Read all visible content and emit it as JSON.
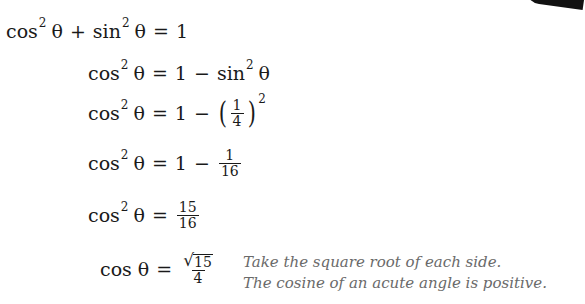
{
  "document": {
    "lines": [
      {
        "lhs_fn": "cos",
        "lhs_exp": "2",
        "lhs_var": "θ",
        "op1": "+",
        "term_fn": "sin",
        "term_exp": "2",
        "term_var": "θ",
        "eq": "=",
        "rhs": "1"
      },
      {
        "lhs_fn": "cos",
        "lhs_exp": "2",
        "lhs_var": "θ",
        "eq": "=",
        "rhs_a": "1",
        "minus": "−",
        "rhs_fn": "sin",
        "rhs_exp": "2",
        "rhs_var": "θ"
      },
      {
        "lhs_fn": "cos",
        "lhs_exp": "2",
        "lhs_var": "θ",
        "eq": "=",
        "rhs_a": "1",
        "minus": "−",
        "lparen": "(",
        "num": "1",
        "den": "4",
        "rparen": ")",
        "exp": "2"
      },
      {
        "lhs_fn": "cos",
        "lhs_exp": "2",
        "lhs_var": "θ",
        "eq": "=",
        "rhs_a": "1",
        "minus": "−",
        "num": "1",
        "den": "16"
      },
      {
        "lhs_fn": "cos",
        "lhs_exp": "2",
        "lhs_var": "θ",
        "eq": "=",
        "num": "15",
        "den": "16"
      },
      {
        "lhs_fn": "cos",
        "lhs_var": "θ",
        "eq": "=",
        "radical": "√",
        "radicand": "15",
        "den": "4"
      }
    ],
    "notes": [
      "Take the square root of each side.",
      "The cosine of an acute angle is positive."
    ]
  }
}
